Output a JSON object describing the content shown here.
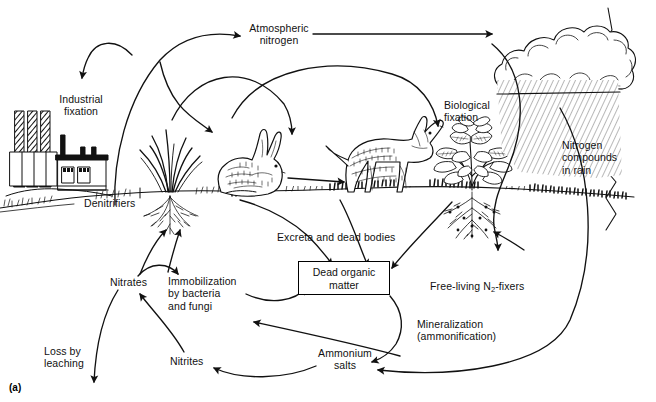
{
  "figure": {
    "panel_label": "(a)",
    "caption_topic": "nitrogen cycle diagram",
    "width": 656,
    "height": 402,
    "ink_color": "#111111",
    "background_color": "#ffffff"
  },
  "labels": {
    "atmospheric_nitrogen": "Atmospheric\nnitrogen",
    "industrial_fixation": "Industrial\nfixation",
    "biological_fixation": "Biological\nfixation",
    "nitrogen_compounds_in_rain": "Nitrogen\ncompounds\nin rain",
    "denitrifiers": "Denitrifiers",
    "excreta_and_dead_bodies": "Excreta and dead bodies",
    "dead_organic_matter": "Dead\norganic matter",
    "free_living_fixers": "Free-living N2-fixers",
    "free_living_fixers_pre": "Free-living N",
    "free_living_fixers_sub": "2",
    "free_living_fixers_post": "-fixers",
    "nitrates": "Nitrates",
    "nitrites": "Nitrites",
    "immobilization": "Immobilization\nby bacteria\nand fungi",
    "mineralization": "Mineralization\n(ammonification)",
    "ammonium_salts": "Ammonium\nsalts",
    "loss_by_leaching": "Loss by\nleaching"
  },
  "scene_elements": [
    {
      "name": "factory",
      "label_ref": "industrial_fixation",
      "detail": "three hatched smokestacks and plant building"
    },
    {
      "name": "grass-clump",
      "label_ref": "denitrifiers",
      "detail": "tufted grass with fibrous root mass"
    },
    {
      "name": "rabbit",
      "label_ref": null,
      "detail": "herbivore grazing on grassland"
    },
    {
      "name": "fox",
      "label_ref": null,
      "detail": "carnivore standing on grassland"
    },
    {
      "name": "legume-plant",
      "label_ref": "biological_fixation",
      "detail": "leafy legume with nodulated roots"
    },
    {
      "name": "rain-cloud",
      "label_ref": "nitrogen_compounds_in_rain",
      "detail": "cumulus cloud with falling rain streaks"
    },
    {
      "name": "ground-line",
      "label_ref": null,
      "detail": "horizon / soil surface across the scene"
    }
  ],
  "flows": [
    {
      "from": "industrial_fixation",
      "to": "atmospheric_nitrogen",
      "name": "industrial-fixation-loop"
    },
    {
      "from": "denitrifiers",
      "to": "atmospheric_nitrogen",
      "name": "denitrification-to-atmosphere"
    },
    {
      "from": "atmospheric_nitrogen",
      "to": "rain-cloud",
      "name": "atmosphere-to-rain"
    },
    {
      "from": "atmospheric_nitrogen",
      "to": "rabbit",
      "name": "atmosphere-downward-left"
    },
    {
      "from": "atmospheric_nitrogen",
      "to": "fox",
      "name": "atmosphere-downward-right"
    },
    {
      "from": "rabbit",
      "to": "fox",
      "name": "herbivore-to-carnivore"
    },
    {
      "from": "rain-cloud",
      "to": "legume-plant",
      "name": "rain-to-soil"
    },
    {
      "from": "fox",
      "to": "dead_organic_matter",
      "name": "excreta-and-dead-bodies"
    },
    {
      "from": "legume-plant",
      "to": "dead_organic_matter",
      "name": "plant-litter-to-dom"
    },
    {
      "from": "dead_organic_matter",
      "to": "ammonium_salts",
      "name": "mineralization-flow"
    },
    {
      "from": "ammonium_salts",
      "to": "nitrites",
      "name": "nitrification-step-1"
    },
    {
      "from": "nitrites",
      "to": "nitrates",
      "name": "nitrification-step-2"
    },
    {
      "from": "nitrates",
      "to": "immobilization",
      "name": "nitrate-immobilization"
    },
    {
      "from": "immobilization",
      "to": "dead_organic_matter",
      "name": "immobilized-to-biomass"
    },
    {
      "from": "nitrates",
      "to": "grass-clump",
      "name": "plant-uptake"
    },
    {
      "from": "nitrates",
      "to": "loss_by_leaching",
      "name": "leaching-loss"
    },
    {
      "from": "free_living_fixers",
      "to": "ammonium_salts",
      "name": "free-living-fixation"
    }
  ]
}
